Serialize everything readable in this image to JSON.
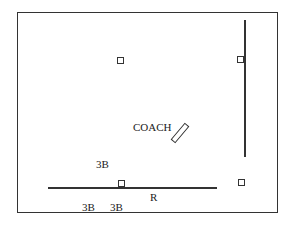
{
  "diagram": {
    "labels": {
      "coach": "COACH",
      "third_base_top": "3B",
      "third_base_bottom_left": "3B",
      "third_base_bottom_right": "3B",
      "runner": "R"
    },
    "bases": [
      {
        "name": "top-left-base"
      },
      {
        "name": "top-right-base"
      },
      {
        "name": "bottom-left-base"
      },
      {
        "name": "bottom-right-base"
      }
    ],
    "colors": {
      "line": "#333333",
      "background": "#ffffff"
    }
  }
}
